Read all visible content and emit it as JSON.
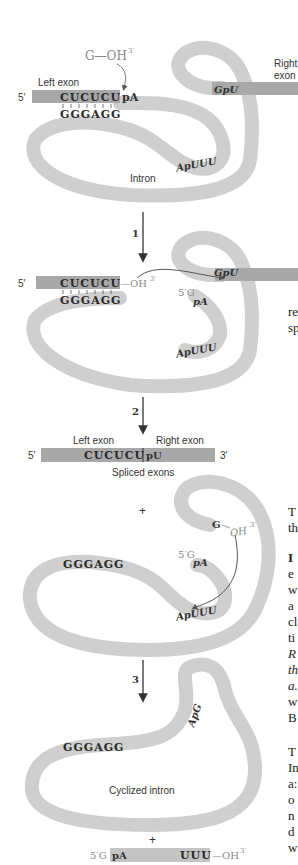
{
  "colors": {
    "intron_tube": "#cfcfcf",
    "exon_bar": "#a8a8a8",
    "text": "#2a2a2a",
    "faded_text": "#8a8a8a",
    "background": "#ffffff"
  },
  "stage0": {
    "guanosine_label": "G—OH",
    "guanosine_superscript": "3′",
    "left_exon_label": "Left exon",
    "right_exon_label_line1": "Right",
    "right_exon_label_line2": "exon",
    "five_prime": "5′",
    "left_exon_seq": "CUCUCU",
    "left_junction": "pA",
    "pairing_seq": "GGGAGG",
    "right_junction": "GpU",
    "internal_seq": "ApUUU",
    "intron_label": "Intron"
  },
  "step1": {
    "number": "1",
    "five_prime": "5′",
    "left_exon_seq": "CUCUCU",
    "oh_label": "—OH",
    "oh_superscript": "3′",
    "pairing_seq": "GGGAGG",
    "guanosine_5prime": "5′G",
    "attached_pA": "pA",
    "right_junction": "GpU",
    "internal_seq": "ApUUU"
  },
  "step2": {
    "number": "2",
    "left_exon_label": "Left exon",
    "right_exon_label": "Right exon",
    "five_prime": "5′",
    "three_prime": "3′",
    "left_seq": "CUCUCU",
    "right_seq": "pU",
    "caption": "Spliced exons",
    "plus": "+",
    "g_oh": "G",
    "g_oh_tail": "OH",
    "g_oh_superscript": "3′",
    "pairing_seq": "GGGAGG",
    "guanosine_5prime": "5′G",
    "attached_pA": "pA",
    "internal_seq": "ApUUU"
  },
  "step3": {
    "number": "3",
    "pairing_seq": "GGGAGG",
    "cyclized_junction": "ApG",
    "caption": "Cyclized intron",
    "plus": "+",
    "fragment_5prime": "5′G",
    "fragment_pA": "pA",
    "fragment_uuu": "UUU",
    "fragment_oh": "—OH",
    "fragment_superscript": "3′"
  },
  "side_text_fragments": [
    {
      "text": "re",
      "y": 316
    },
    {
      "text": "sp",
      "y": 332
    },
    {
      "text": "T",
      "y": 516
    },
    {
      "text": "th",
      "y": 532
    },
    {
      "text": "I",
      "y": 562,
      "bold": true
    },
    {
      "text": "e",
      "y": 578
    },
    {
      "text": "w",
      "y": 594
    },
    {
      "text": "a",
      "y": 610
    },
    {
      "text": "cl",
      "y": 626
    },
    {
      "text": "ti",
      "y": 642
    },
    {
      "text": "R",
      "y": 658,
      "italic": true
    },
    {
      "text": "th",
      "y": 674,
      "italic": true
    },
    {
      "text": "a.",
      "y": 690,
      "italic": true
    },
    {
      "text": "w",
      "y": 706
    },
    {
      "text": "B",
      "y": 722
    },
    {
      "text": "T",
      "y": 756,
      "small": true
    },
    {
      "text": "In",
      "y": 772
    },
    {
      "text": "a:",
      "y": 788
    },
    {
      "text": "o",
      "y": 804
    },
    {
      "text": "n",
      "y": 820
    },
    {
      "text": "d",
      "y": 836
    },
    {
      "text": "w",
      "y": 852
    }
  ]
}
